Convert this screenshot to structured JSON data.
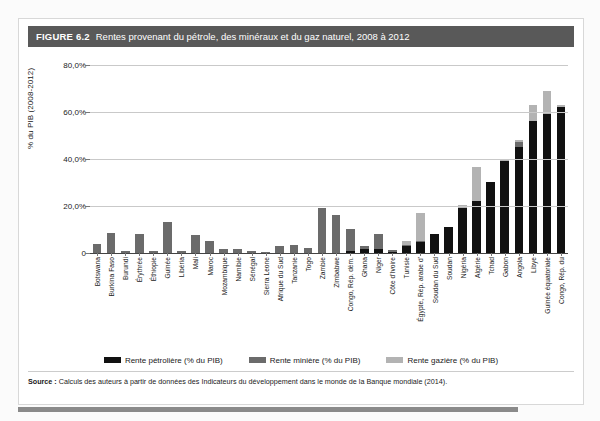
{
  "figure": {
    "number_label": "FIGURE 6.2",
    "title": "Rentes provenant du pétrole, des minéraux et du gaz naturel, 2008 à 2012",
    "source_label": "Source :",
    "source_text": "Calculs des auteurs à partir de données des Indicateurs du développement dans le monde de la Banque mondiale (2014)."
  },
  "colors": {
    "header_bar": "#595959",
    "oil": "#111111",
    "mineral": "#6b6b6b",
    "gas": "#b3b3b3",
    "gridline": "#c9c9c9",
    "axis": "#444444"
  },
  "legend": {
    "position": "bottom-center",
    "items": [
      {
        "label": "Rente pétrolière (% du PIB)",
        "color": "#111111",
        "key": "oil"
      },
      {
        "label": "Rente minière (% du PIB)",
        "color": "#6b6b6b",
        "key": "mineral"
      },
      {
        "label": "Rente gazière (% du PIB)",
        "color": "#b3b3b3",
        "key": "gas"
      }
    ]
  },
  "chart_data": {
    "type": "bar",
    "stacked": true,
    "title": "Rentes provenant du pétrole, des minéraux et du gaz naturel, 2008 à 2012",
    "xlabel": "",
    "ylabel": "% du PIB (2008-2012)",
    "ylim": [
      0,
      85
    ],
    "grid": true,
    "ytick_values": [
      0,
      20,
      40,
      60,
      80
    ],
    "ytick_labels": [
      "0",
      "20,0%",
      "40,0%",
      "60,0%",
      "80,0%"
    ],
    "categories": [
      "Botswana",
      "Burkina Faso",
      "Burundi",
      "Érythrée",
      "Éthiopie",
      "Guinée",
      "Libéria",
      "Mali",
      "Maroc",
      "Mozambique",
      "Namibie",
      "Sénégal",
      "Sierra Leone",
      "Afrique du Sud",
      "Tanzanie",
      "Togo",
      "Zambie",
      "Zimbabwe",
      "Congo, Rép. dém.",
      "Ghana",
      "Niger",
      "Côte d'Ivoire",
      "Tunisie",
      "Égypte, Rép. arabe d'",
      "Soudan du Sud",
      "Soudan",
      "Nigéria",
      "Algérie",
      "Tchad",
      "Gabon",
      "Angola",
      "Libye",
      "Guinée équatoriale",
      "Congo, Rép. du"
    ],
    "series": [
      {
        "name": "Rente pétrolière (% du PIB)",
        "key": "oil",
        "color": "#111111",
        "values": [
          0.0,
          0.0,
          0.0,
          0.0,
          0.0,
          0.0,
          0.0,
          0.0,
          0.0,
          0.0,
          0.0,
          0.0,
          0.0,
          0.0,
          0.0,
          0.0,
          0.0,
          0.0,
          1.0,
          1.8,
          1.5,
          0.6,
          3.0,
          4.5,
          8.0,
          11.0,
          19.0,
          22.0,
          30.0,
          39.0,
          45.0,
          56.0,
          59.0,
          62.0
        ]
      },
      {
        "name": "Rente minière (% du PIB)",
        "key": "mineral",
        "color": "#6b6b6b",
        "values": [
          4.0,
          8.5,
          1.0,
          8.0,
          1.0,
          13.0,
          1.0,
          7.5,
          5.0,
          1.5,
          1.5,
          1.0,
          0.5,
          3.0,
          3.5,
          2.0,
          19.0,
          16.0,
          9.0,
          1.2,
          6.5,
          0.5,
          0.5,
          0.5,
          0.0,
          0.0,
          0.0,
          0.0,
          0.0,
          0.0,
          2.0,
          0.0,
          0.0,
          0.0
        ]
      },
      {
        "name": "Rente gazière (% du PIB)",
        "key": "gas",
        "color": "#b3b3b3",
        "values": [
          0.0,
          0.0,
          0.0,
          0.0,
          0.0,
          0.0,
          0.0,
          0.0,
          0.0,
          0.0,
          0.0,
          0.0,
          0.0,
          0.0,
          0.0,
          0.0,
          0.0,
          0.0,
          0.0,
          0.0,
          0.0,
          0.0,
          1.5,
          12.0,
          0.0,
          0.0,
          1.5,
          14.5,
          0.0,
          1.0,
          1.0,
          7.0,
          10.0,
          1.0
        ]
      }
    ]
  }
}
